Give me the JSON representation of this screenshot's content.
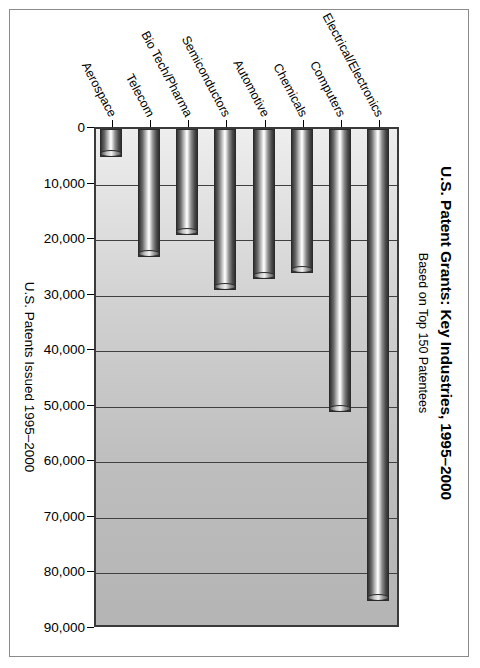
{
  "chart_data": {
    "type": "bar",
    "orientation": "horizontal",
    "title": "U.S. Patent Grants: Key Industries, 1995–2000",
    "subtitle": "Based on Top 150 Patentees",
    "xlabel": "U.S. Patents Issued 1995–2000",
    "ylabel": "",
    "categories": [
      "Electrical/Electronics",
      "Computers",
      "Chemicals",
      "Automotive",
      "Semiconductors",
      "Bio Tech/Pharma",
      "Telecom",
      "Aerospace"
    ],
    "values": [
      85000,
      51000,
      26000,
      27000,
      29000,
      19000,
      23000,
      5000
    ],
    "value_axis_ticks": [
      0,
      10000,
      20000,
      30000,
      40000,
      50000,
      60000,
      70000,
      80000,
      90000
    ],
    "tick_labels": [
      "0",
      "10,000",
      "20,000",
      "30,000",
      "40,000",
      "50,000",
      "60,000",
      "70,000",
      "80,000",
      "90,000"
    ],
    "xlim": [
      0,
      90000
    ],
    "grid": true,
    "legend": false,
    "bar_style": "3d-cylinder",
    "colors": {
      "plot_background_light": "#eeeeee",
      "plot_background_dark": "#b4b4b4",
      "gridline": "#404040",
      "bar_highlight": "#fbfbfb",
      "bar_shadow": "#2f2f2f",
      "axis": "#000000",
      "frame": "#8a8a8a",
      "text": "#000000"
    }
  }
}
